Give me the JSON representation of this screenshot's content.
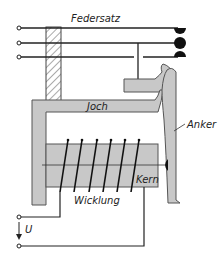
{
  "labels": {
    "federsatz": "Federsatz",
    "joch": "Joch",
    "anker": "Anker",
    "kern": "Kern",
    "wicklung": "Wicklung",
    "voltage": "U"
  },
  "colors": {
    "part_fill": "#c8c8c8",
    "part_stroke": "#555555",
    "line": "#222222",
    "background": "#ffffff"
  }
}
